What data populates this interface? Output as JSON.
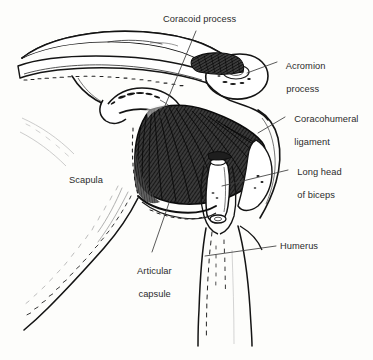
{
  "figure": {
    "type": "anatomical-line-drawing",
    "background_color": "#fdfdfb",
    "ink_color": "#1a1a1a",
    "text_color": "#2b2b2b",
    "shade_color": "#2a2a2a",
    "width": 373,
    "height": 360
  },
  "labels": [
    {
      "id": "coracoid-process",
      "lines": [
        "Coracoid process"
      ],
      "text": "Coracoid process",
      "x": 163,
      "y": 14,
      "align": "left",
      "leader": {
        "x1": 196,
        "y1": 31,
        "x2": 160,
        "y2": 118
      }
    },
    {
      "id": "acromion-process",
      "lines": [
        "Acromion",
        "process"
      ],
      "text": "Acromion process",
      "x": 281,
      "y": 50,
      "align": "left",
      "leader": {
        "x1": 277,
        "y1": 62,
        "x2": 247,
        "y2": 73
      }
    },
    {
      "id": "coracohumeral-ligament",
      "lines": [
        "Coracohumeral",
        "ligament"
      ],
      "text": "Coracohumeral ligament",
      "x": 289,
      "y": 103,
      "align": "left",
      "leader": {
        "x1": 285,
        "y1": 117,
        "x2": 258,
        "y2": 133
      }
    },
    {
      "id": "long-head-of-biceps",
      "lines": [
        "Long head",
        "of biceps"
      ],
      "text": "Long head of biceps",
      "x": 292,
      "y": 156,
      "align": "left",
      "leader": {
        "x1": 288,
        "y1": 170,
        "x2": 222,
        "y2": 186
      }
    },
    {
      "id": "humerus",
      "lines": [
        "Humerus"
      ],
      "text": "Humerus",
      "x": 280,
      "y": 241,
      "align": "left",
      "leader": {
        "x1": 276,
        "y1": 246,
        "x2": 205,
        "y2": 256
      }
    },
    {
      "id": "scapula",
      "lines": [
        "Scapula"
      ],
      "text": "Scapula",
      "x": 69,
      "y": 175,
      "align": "left",
      "leader": null
    },
    {
      "id": "articular-capsule",
      "lines": [
        "Articular",
        "capsule"
      ],
      "text": "Articular capsule",
      "x": 120,
      "y": 255,
      "align": "center",
      "leader": {
        "x1": 152,
        "y1": 252,
        "x2": 170,
        "y2": 200
      }
    }
  ],
  "structures": [
    {
      "id": "clavicle",
      "name": "Clavicle"
    },
    {
      "id": "scapular-spine",
      "name": "Spine of scapula"
    },
    {
      "id": "acromion",
      "name": "Acromion"
    },
    {
      "id": "coracoid",
      "name": "Coracoid process"
    },
    {
      "id": "coracohumeral-ligament-fan",
      "name": "Coracohumeral ligament"
    },
    {
      "id": "biceps-tendon",
      "name": "Long head of biceps tendon"
    },
    {
      "id": "humerus-shaft",
      "name": "Humerus"
    },
    {
      "id": "scapula-body",
      "name": "Scapula body"
    },
    {
      "id": "articular-capsule-region",
      "name": "Articular capsule"
    }
  ]
}
